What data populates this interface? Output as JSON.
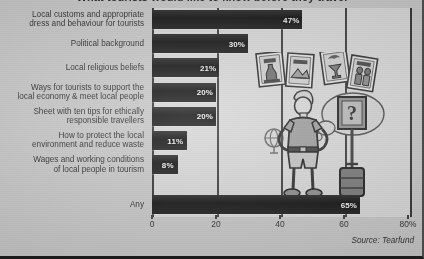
{
  "figure": {
    "title_partial": "What tourists would like to know before they travel",
    "source": "Source: Tearfund",
    "background_color": "#c6c6c6",
    "plot_color": "#d7d7d7",
    "bar_color": "#141414",
    "axis_color": "#3a3a3a"
  },
  "chart_data": {
    "type": "bar",
    "orientation": "horizontal",
    "title": "What tourists would like to know before they travel",
    "xlabel": "",
    "ylabel": "",
    "xlim": [
      0,
      80
    ],
    "xticks": [
      0,
      20,
      40,
      60,
      80
    ],
    "xtick_labels": [
      "0",
      "20",
      "40",
      "60",
      "80%"
    ],
    "grid": true,
    "legend": "none",
    "value_format": "percent",
    "categories": [
      "Local customs and appropriate dress and behaviour for tourists",
      "Political background",
      "Local religious beliefs",
      "Ways for tourists to support the local economy & meet local people",
      "Sheet with ten tips for ethically responsible travellers",
      "How to protect the local environment and reduce waste",
      "Wages and working conditions of local people in tourism",
      "Any"
    ],
    "values": [
      47,
      30,
      21,
      20,
      20,
      11,
      8,
      65
    ],
    "data_labels": [
      "47%",
      "30%",
      "21%",
      "20%",
      "20%",
      "11%",
      "8%",
      "65%"
    ],
    "annotations": [
      "Source: Tearfund"
    ]
  },
  "categories_display": [
    {
      "line1": "Local customs and appropriate",
      "line2": "dress and behaviour for tourists"
    },
    {
      "line1": "Political background",
      "line2": ""
    },
    {
      "line1": "Local religious beliefs",
      "line2": ""
    },
    {
      "line1": "Ways for tourists to support the",
      "line2": "local economy & meet local people"
    },
    {
      "line1": "Sheet with ten tips for ethically",
      "line2": "responsible travellers"
    },
    {
      "line1": "How to protect the local",
      "line2": "environment and reduce waste"
    },
    {
      "line1": "Wages and working conditions",
      "line2": "of local people in tourism"
    },
    {
      "line1": "Any",
      "line2": ""
    }
  ],
  "illustration": {
    "description": "tourist with hands on hips beside a suitcase, thinking of an information sign, with four travel leaflets above",
    "leaflet_count": 4,
    "thought_symbol": "?"
  }
}
